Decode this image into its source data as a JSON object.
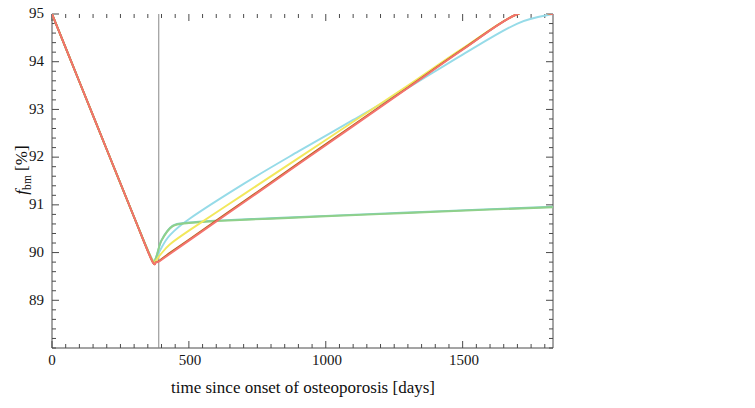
{
  "figure": {
    "width": 755,
    "height": 408
  },
  "chart_data": {
    "type": "line",
    "title": "",
    "subtitle": "",
    "xlabel": "time since onset of osteoporosis [days]",
    "ylabel": "f_bm [%]",
    "ylabel_parts": {
      "symbol": "f",
      "subscript": "bm",
      "unit": "[%]"
    },
    "xlim": [
      0,
      1830
    ],
    "ylim": [
      88.0,
      95.0
    ],
    "xticks": [
      0,
      500,
      1000,
      1500
    ],
    "xticklabels": [
      "0",
      "500",
      "1000",
      "1500"
    ],
    "yticks": [
      89,
      90,
      91,
      92,
      93,
      94,
      95
    ],
    "yticklabels": [
      "89",
      "90",
      "91",
      "92",
      "93",
      "94",
      "95"
    ],
    "minor_ticks": true,
    "grid": false,
    "legend_position": "right",
    "annotations": [
      {
        "type": "vline",
        "x": 390,
        "label": "",
        "color": "#888888"
      }
    ],
    "series": [
      {
        "name": "D_OBu",
        "label_symbol": "D",
        "label_subscript": "OBu",
        "color": "#f4736f",
        "x": [
          0,
          100,
          200,
          300,
          365,
          380,
          390,
          420,
          500,
          700,
          900,
          1100,
          1300,
          1500,
          1700,
          1830
        ],
        "y": [
          95.0,
          93.58,
          92.16,
          90.74,
          89.83,
          89.8,
          89.81,
          89.93,
          90.25,
          91.05,
          91.85,
          92.65,
          93.45,
          94.25,
          95.0,
          95.0
        ]
      },
      {
        "name": "P_OBp",
        "label_symbol": "P",
        "label_subscript": "OBp",
        "color": "#b5651d",
        "x": [
          0,
          100,
          200,
          300,
          365,
          380,
          390,
          420,
          500,
          700,
          900,
          1100,
          1300,
          1500,
          1700,
          1830
        ],
        "y": [
          95.0,
          93.58,
          92.16,
          90.74,
          89.83,
          89.8,
          89.82,
          89.95,
          90.27,
          91.07,
          91.87,
          92.67,
          93.46,
          94.26,
          95.0,
          95.0
        ]
      },
      {
        "name": "A_OBa",
        "label_symbol": "A",
        "label_subscript": "OBa",
        "color": "#f2e85c",
        "x": [
          0,
          100,
          200,
          300,
          365,
          380,
          395,
          430,
          500,
          700,
          900,
          1100,
          1300,
          1500,
          1700,
          1830
        ],
        "y": [
          95.0,
          93.58,
          92.16,
          90.74,
          89.85,
          89.84,
          89.95,
          90.17,
          90.46,
          91.22,
          91.98,
          92.74,
          93.5,
          94.28,
          95.0,
          95.0
        ]
      },
      {
        "name": "A_OCa",
        "label_symbol": "A",
        "label_subscript": "OCa",
        "color": "#8fd08a",
        "x": [
          0,
          100,
          200,
          300,
          365,
          380,
          400,
          440,
          500,
          600,
          800,
          1000,
          1300,
          1600,
          1830
        ],
        "y": [
          95.0,
          93.58,
          92.16,
          90.74,
          89.86,
          89.9,
          90.25,
          90.55,
          90.62,
          90.66,
          90.71,
          90.76,
          90.83,
          90.9,
          90.95
        ]
      },
      {
        "name": "k_RANK-RANKL",
        "label_symbol": "k",
        "label_subscript": "RANK–RANKL",
        "color": "#7ecfc0",
        "x": [
          0,
          100,
          200,
          300,
          365,
          380,
          400,
          440,
          500,
          600,
          800,
          1000,
          1300,
          1600,
          1830
        ],
        "y": [
          95.0,
          93.58,
          92.16,
          90.74,
          89.86,
          89.9,
          90.26,
          90.56,
          90.63,
          90.67,
          90.72,
          90.77,
          90.84,
          90.91,
          90.96
        ]
      },
      {
        "name": "D_OBp",
        "label_symbol": "D",
        "label_subscript": "OBp",
        "color": "#96dbe8",
        "x": [
          0,
          100,
          200,
          300,
          365,
          380,
          395,
          430,
          500,
          700,
          900,
          1100,
          1300,
          1500,
          1700,
          1830
        ],
        "y": [
          95.0,
          93.58,
          92.16,
          90.74,
          89.86,
          89.88,
          90.05,
          90.36,
          90.7,
          91.44,
          92.12,
          92.78,
          93.45,
          94.15,
          94.8,
          95.0
        ]
      }
    ]
  },
  "legend": {
    "items": [
      {
        "symbol": "D",
        "subscript": "OBu",
        "color": "#f4736f"
      },
      {
        "symbol": "P",
        "subscript": "OBp",
        "color": "#b5651d"
      },
      {
        "symbol": "A",
        "subscript": "OBa",
        "color": "#f2e85c"
      },
      {
        "symbol": "A",
        "subscript": "OCa",
        "color": "#8fd08a"
      },
      {
        "symbol": "k",
        "subscript": "RANK–RANKL",
        "color": "#7ecfc0"
      },
      {
        "symbol": "D",
        "subscript": "OBp",
        "color": "#96dbe8"
      }
    ]
  },
  "axes": {
    "x_title": "time since onset of osteoporosis [days]",
    "y_symbol": "f",
    "y_subscript": "bm",
    "y_unit": "[%]"
  }
}
